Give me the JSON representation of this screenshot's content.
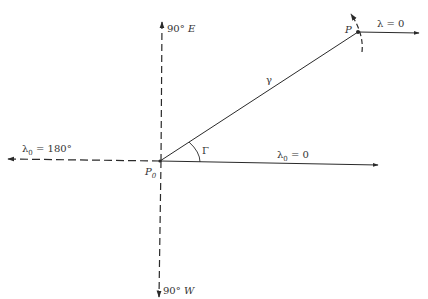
{
  "diagram": {
    "points": {
      "origin": {
        "label": "P",
        "subscript": "0",
        "x": 160,
        "y": 161
      },
      "target": {
        "label": "P",
        "x": 358,
        "y": 32
      }
    },
    "axes": {
      "north_up": {
        "label_num": "90°",
        "label_letter": "E",
        "style": "dashed"
      },
      "south_down": {
        "label_num": "90°",
        "label_letter": "W",
        "style": "dashed"
      },
      "left": {
        "label_symbol": "λ",
        "label_subscript": "0",
        "label_value": "= 180°",
        "style": "dashed"
      },
      "right": {
        "label_symbol": "λ",
        "label_subscript": "0",
        "label_value": "= 0",
        "style": "solid"
      }
    },
    "great_circle": {
      "label": "γ"
    },
    "angle": {
      "label": "Γ"
    },
    "target_direction": {
      "label_symbol": "λ",
      "label_value": "= 0"
    },
    "colors": {
      "line": "#2a2a2a",
      "background": "#ffffff"
    }
  }
}
